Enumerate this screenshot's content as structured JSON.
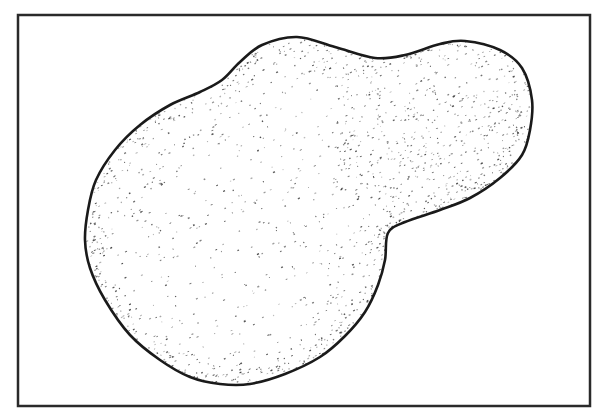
{
  "figure": {
    "colors": {
      "background": "#ffffff",
      "outline": "#1a1a1a",
      "stipple": "#3a3a3a",
      "frame": "#2a2a2a"
    },
    "frame": {
      "x": 18,
      "y": 15,
      "width": 572,
      "height": 391
    },
    "blob_outline": [
      [
        297,
        37
      ],
      [
        335,
        47
      ],
      [
        375,
        58
      ],
      [
        405,
        55
      ],
      [
        440,
        44
      ],
      [
        465,
        41
      ],
      [
        500,
        50
      ],
      [
        522,
        68
      ],
      [
        532,
        100
      ],
      [
        530,
        130
      ],
      [
        522,
        155
      ],
      [
        500,
        178
      ],
      [
        470,
        198
      ],
      [
        440,
        210
      ],
      [
        405,
        222
      ],
      [
        388,
        233
      ],
      [
        385,
        260
      ],
      [
        378,
        285
      ],
      [
        365,
        312
      ],
      [
        345,
        336
      ],
      [
        320,
        357
      ],
      [
        285,
        374
      ],
      [
        250,
        384
      ],
      [
        220,
        384
      ],
      [
        190,
        377
      ],
      [
        160,
        360
      ],
      [
        130,
        335
      ],
      [
        105,
        300
      ],
      [
        90,
        268
      ],
      [
        85,
        240
      ],
      [
        88,
        210
      ],
      [
        96,
        180
      ],
      [
        115,
        150
      ],
      [
        140,
        125
      ],
      [
        170,
        105
      ],
      [
        200,
        92
      ],
      [
        222,
        80
      ],
      [
        240,
        62
      ],
      [
        262,
        45
      ]
    ]
  }
}
